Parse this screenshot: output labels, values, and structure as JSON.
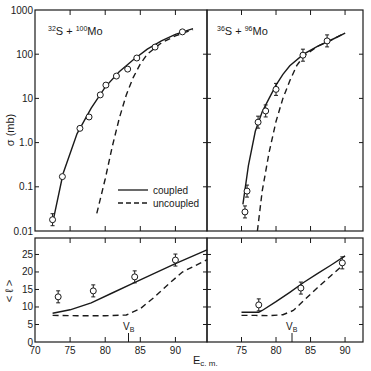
{
  "figure": {
    "y_label_top": "σ (mb)",
    "y_label_bottom": "< ℓ >",
    "x_label": "Ec.m.",
    "vb_label": "VB",
    "legend": {
      "coupled": "coupled",
      "uncoupled": "uncoupled"
    },
    "top_y_ticks": [
      "1000",
      "100",
      "10",
      "1.0",
      "0.1",
      "0.01"
    ],
    "bottom_y_ticks": [
      "25",
      "20",
      "15",
      "10",
      "5",
      "0"
    ],
    "left_x_ticks": [
      "70",
      "75",
      "80",
      "85",
      "90"
    ],
    "right_x_ticks": [
      "75",
      "80",
      "85",
      "90"
    ],
    "colors": {
      "ink": "#1a1a1a",
      "background": "#ffffff"
    }
  },
  "chart_data": [
    {
      "type": "line",
      "panel": "top-left",
      "title": "32S + 100Mo",
      "xlabel": "Ec.m.",
      "ylabel": "σ (mb)",
      "yscale": "log",
      "xlim": [
        70,
        94.5
      ],
      "ylim": [
        0.01,
        1000
      ],
      "points": {
        "x": [
          72.5,
          73.9,
          76.4,
          77.7,
          79.3,
          80.1,
          81.6,
          83.2,
          84.5,
          87.1,
          91.0
        ],
        "y": [
          0.018,
          0.17,
          2.1,
          3.8,
          12,
          20,
          32,
          46,
          82,
          145,
          320
        ]
      },
      "series": [
        {
          "name": "coupled",
          "style": "solid",
          "x": [
            72.5,
            74,
            76,
            78,
            80,
            82,
            84,
            86,
            88,
            90,
            92.5
          ],
          "y": [
            0.015,
            0.2,
            1.6,
            6,
            18,
            40,
            75,
            130,
            200,
            280,
            380
          ]
        },
        {
          "name": "uncoupled",
          "style": "dashed",
          "x": [
            78.8,
            80,
            81,
            82,
            83,
            84,
            85,
            86,
            88,
            90,
            92.5
          ],
          "y": [
            0.025,
            0.15,
            0.8,
            3.5,
            12,
            30,
            60,
            100,
            180,
            260,
            360
          ]
        }
      ],
      "legend_position": "lower right"
    },
    {
      "type": "line",
      "panel": "top-right",
      "title": "36S + 96Mo",
      "xlabel": "Ec.m.",
      "ylabel": "σ (mb)",
      "yscale": "log",
      "xlim": [
        70,
        92.6
      ],
      "ylim": [
        0.01,
        1000
      ],
      "points": {
        "x": [
          75.5,
          75.8,
          77.4,
          78.5,
          80.0,
          83.9,
          87.4
        ],
        "y": [
          0.027,
          0.08,
          2.9,
          5.2,
          16,
          95,
          200
        ]
      },
      "series": [
        {
          "name": "coupled",
          "style": "solid",
          "x": [
            75.2,
            76,
            77,
            78,
            79,
            80,
            81,
            82,
            84,
            86,
            88,
            90
          ],
          "y": [
            0.04,
            0.3,
            1.8,
            5,
            10,
            20,
            35,
            55,
            100,
            150,
            210,
            300
          ]
        },
        {
          "name": "uncoupled",
          "style": "dashed",
          "x": [
            77.3,
            78,
            79,
            80,
            81,
            82,
            83,
            84,
            86,
            88,
            90
          ],
          "y": [
            0.01,
            0.08,
            0.6,
            3,
            10,
            25,
            55,
            90,
            150,
            210,
            300
          ]
        }
      ]
    },
    {
      "type": "line",
      "panel": "bottom-left",
      "xlabel": "Ec.m.",
      "ylabel": "< ℓ >",
      "xlim": [
        70,
        94.5
      ],
      "ylim": [
        0,
        29.7
      ],
      "annotations": [
        {
          "text": "VB",
          "x": 83.7
        }
      ],
      "points": {
        "x": [
          73.3,
          78.3,
          84.2,
          90.0
        ],
        "y": [
          12.9,
          14.6,
          18.6,
          23.4
        ]
      },
      "series": [
        {
          "name": "coupled",
          "style": "solid",
          "x": [
            72.5,
            75,
            78,
            81,
            84,
            87,
            90,
            94.5
          ],
          "y": [
            8.2,
            9.2,
            11.2,
            14,
            16.8,
            19.6,
            22.4,
            26.3
          ]
        },
        {
          "name": "uncoupled",
          "style": "dashed",
          "x": [
            72.5,
            76,
            80,
            83,
            85,
            87,
            89,
            91,
            94.5
          ],
          "y": [
            7.6,
            7.5,
            7.5,
            7.7,
            9.5,
            12.8,
            16.5,
            20,
            23.5
          ]
        }
      ]
    },
    {
      "type": "line",
      "panel": "bottom-right",
      "xlabel": "Ec.m.",
      "ylabel": "< ℓ >",
      "xlim": [
        70,
        92.6
      ],
      "ylim": [
        0,
        29.7
      ],
      "annotations": [
        {
          "text": "VB",
          "x": 82.3
        }
      ],
      "points": {
        "x": [
          77.5,
          83.6,
          89.6
        ],
        "y": [
          10.6,
          15.4,
          22.6
        ]
      },
      "series": [
        {
          "name": "coupled",
          "style": "solid",
          "x": [
            75,
            77.5,
            78,
            80,
            82,
            84,
            86,
            88,
            90
          ],
          "y": [
            8.5,
            8.5,
            9,
            11.5,
            14.2,
            17,
            19.5,
            22,
            24.6
          ]
        },
        {
          "name": "uncoupled",
          "style": "dashed",
          "x": [
            75,
            77,
            79,
            81,
            82.5,
            84,
            86,
            88,
            90
          ],
          "y": [
            7.6,
            7.6,
            7.5,
            7.8,
            9,
            11.8,
            15.5,
            19,
            22.5
          ]
        }
      ]
    }
  ]
}
